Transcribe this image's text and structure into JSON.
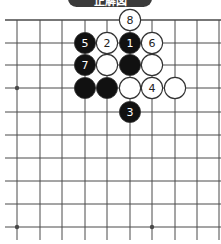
{
  "title": "正解図",
  "caption": "",
  "colors": {
    "grid_line": "#4a4a4a",
    "black_stone": "#111111",
    "white_stone": "#ffffff",
    "stone_outline": "#333333",
    "banner": "#3b3b3b"
  },
  "board": {
    "x_coords": [
      17,
      40,
      62,
      85,
      107,
      130,
      152,
      175,
      197,
      219
    ],
    "y_coords": [
      20,
      43,
      65,
      88,
      112,
      135,
      158,
      181,
      204,
      227
    ],
    "top_edge": true,
    "hoshi": [
      [
        0,
        3
      ],
      [
        0,
        9
      ],
      [
        6,
        9
      ]
    ],
    "stones": [
      {
        "col": 5,
        "row": 0,
        "color": "white",
        "label": "8"
      },
      {
        "col": 3,
        "row": 1,
        "color": "black",
        "label": "5"
      },
      {
        "col": 4,
        "row": 1,
        "color": "white",
        "label": "2"
      },
      {
        "col": 5,
        "row": 1,
        "color": "black",
        "label": "1"
      },
      {
        "col": 6,
        "row": 1,
        "color": "white",
        "label": "6"
      },
      {
        "col": 3,
        "row": 2,
        "color": "black",
        "label": "7"
      },
      {
        "col": 4,
        "row": 2,
        "color": "white",
        "label": ""
      },
      {
        "col": 5,
        "row": 2,
        "color": "black",
        "label": ""
      },
      {
        "col": 6,
        "row": 2,
        "color": "white",
        "label": ""
      },
      {
        "col": 3,
        "row": 3,
        "color": "black",
        "label": ""
      },
      {
        "col": 4,
        "row": 3,
        "color": "black",
        "label": ""
      },
      {
        "col": 5,
        "row": 3,
        "color": "white",
        "label": ""
      },
      {
        "col": 6,
        "row": 3,
        "color": "white",
        "label": "4"
      },
      {
        "col": 7,
        "row": 3,
        "color": "white",
        "label": ""
      },
      {
        "col": 5,
        "row": 4,
        "color": "black",
        "label": "3"
      }
    ]
  }
}
